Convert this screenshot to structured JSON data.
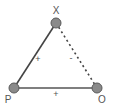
{
  "diagram": {
    "type": "signed-graph-triangle",
    "nodes": [
      {
        "id": "X",
        "label": "X",
        "x": 56,
        "y": 23
      },
      {
        "id": "P",
        "label": "P",
        "x": 14,
        "y": 88
      },
      {
        "id": "O",
        "label": "O",
        "x": 97,
        "y": 88
      }
    ],
    "edges": [
      {
        "from": "P",
        "to": "X",
        "sign": "+",
        "style": "solid"
      },
      {
        "from": "X",
        "to": "O",
        "sign": "-",
        "style": "dotted"
      },
      {
        "from": "P",
        "to": "O",
        "sign": "+",
        "style": "solid"
      }
    ],
    "colors": {
      "node_fill": "#8a8a8a",
      "node_stroke": "#555555",
      "edge": "#444444",
      "label": "#555555"
    }
  }
}
